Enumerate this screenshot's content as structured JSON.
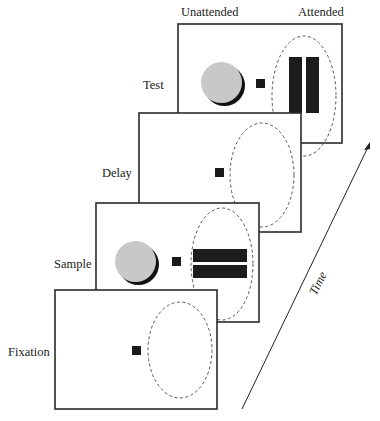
{
  "diagram": {
    "column_labels": {
      "unattended": "Unattended",
      "attended": "Attended"
    },
    "axis_label": "Time",
    "frames": [
      {
        "name": "Fixation",
        "label": "Fixation",
        "stimulus_unattended": "none",
        "stimulus_attended": "none"
      },
      {
        "name": "Sample",
        "label": "Sample",
        "stimulus_unattended": "gray disc",
        "stimulus_attended": "two horizontal black bars"
      },
      {
        "name": "Delay",
        "label": "Delay",
        "stimulus_unattended": "none",
        "stimulus_attended": "none"
      },
      {
        "name": "Test",
        "label": "Test",
        "stimulus_unattended": "gray disc",
        "stimulus_attended": "two vertical black bars"
      }
    ],
    "colors": {
      "frame_stroke": "#2a2a2a",
      "disc": "#c8c8c8",
      "bars": "#1c1c1c",
      "fixation_point": "#1a1a1a",
      "attention_ellipse": "#555555"
    }
  }
}
